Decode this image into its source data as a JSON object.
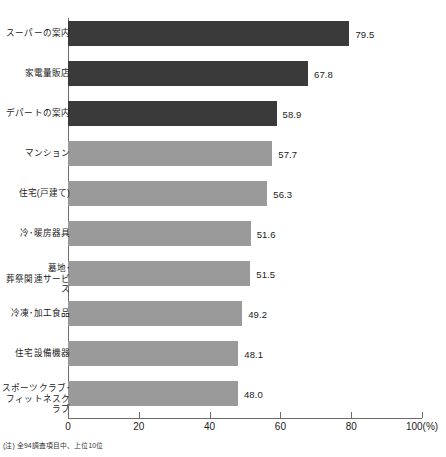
{
  "chart_data": {
    "type": "bar",
    "orientation": "horizontal",
    "title": "",
    "xlabel": "",
    "ylabel": "",
    "xlim": [
      0,
      100
    ],
    "xticks": [
      0,
      20,
      40,
      60,
      80,
      100
    ],
    "xtick_labels": [
      "0",
      "20",
      "40",
      "60",
      "80",
      "100(%)"
    ],
    "grid": false,
    "legend": "none",
    "categories": [
      "スーパーの案内",
      "家電量販店",
      "デパートの案内",
      "マンション",
      "住宅(戸建て)",
      "冷･暖房器具",
      "墓地･\n葬祭関連サービス",
      "冷凍･加工食品",
      "住宅設備機器",
      "スポーツクラブ･\nフィットネスクラブ"
    ],
    "values": [
      79.5,
      67.8,
      58.9,
      57.7,
      56.3,
      51.6,
      51.5,
      49.2,
      48.1,
      48.0
    ],
    "value_labels": [
      "79.5",
      "67.8",
      "58.9",
      "57.7",
      "56.3",
      "51.6",
      "51.5",
      "49.2",
      "48.1",
      "48.0"
    ],
    "bar_colors": [
      "#3a3a3a",
      "#3a3a3a",
      "#3a3a3a",
      "#9a9a9a",
      "#9a9a9a",
      "#9a9a9a",
      "#9a9a9a",
      "#9a9a9a",
      "#9a9a9a",
      "#9a9a9a"
    ],
    "annotations": [
      "(注) 全94調査項目中、上位10位"
    ]
  },
  "footnote": "(注) 全94調査項目中、上位10位",
  "axis_colors": {
    "axis_line": "#6b6b6b",
    "dark_bar": "#3a3a3a",
    "light_bar": "#9a9a9a"
  }
}
